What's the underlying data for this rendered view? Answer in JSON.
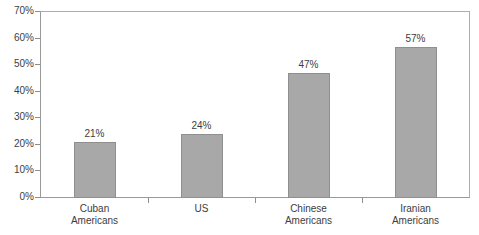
{
  "chart_data": {
    "type": "bar",
    "title": "",
    "xlabel": "",
    "ylabel": "",
    "categories": [
      "Cuban Americans",
      "US",
      "Chinese Americans",
      "Iranian Americans"
    ],
    "category_labels_wrapped": [
      "Cuban\nAmericans",
      "US",
      "Chinese\nAmericans",
      "Iranian\nAmericans"
    ],
    "values": [
      21,
      24,
      47,
      57
    ],
    "value_labels": [
      "21%",
      "24%",
      "47%",
      "57%"
    ],
    "ylim": [
      0,
      70
    ],
    "ytick_labels": [
      "0%",
      "10%",
      "20%",
      "30%",
      "40%",
      "50%",
      "60%",
      "70%"
    ],
    "ytick_values": [
      0,
      10,
      20,
      30,
      40,
      50,
      60,
      70
    ],
    "grid": false,
    "legend": false,
    "bar_color": "#a8a8a8",
    "bar_border_color": "#8f8f8f",
    "axis_color": "#8e8e8e",
    "text_color": "#3d3d3d"
  }
}
